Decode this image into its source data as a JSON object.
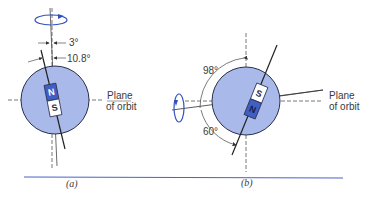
{
  "figure": {
    "panel_a": {
      "caption": "(a)",
      "angle_small": "3°",
      "angle_large": "10.8°",
      "magnet_north": "N",
      "magnet_south": "S",
      "plane_label_line1": "Plane",
      "plane_label_line2": "of orbit"
    },
    "panel_b": {
      "caption": "(b)",
      "angle_top": "98°",
      "angle_bottom": "60°",
      "magnet_north": "N",
      "magnet_south": "S",
      "plane_label_line1": "Plane",
      "plane_label_line2": "of orbit"
    },
    "colors": {
      "planet_fill": "#a9b9ea",
      "planet_stroke": "#2b2f4a",
      "magnet_north": "#3f5fc4",
      "magnet_south": "#ffffff",
      "rotation_arrow": "#2f4fbf",
      "rule": "#4a63c9"
    }
  }
}
